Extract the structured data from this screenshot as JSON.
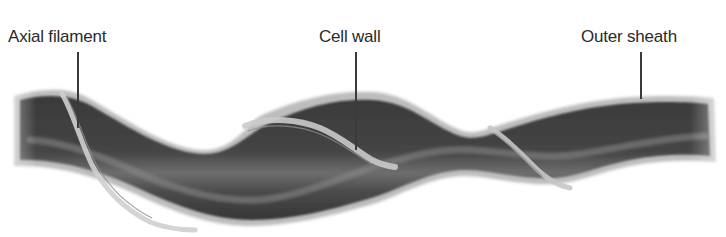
{
  "diagram": {
    "labels": [
      {
        "id": "axial-filament",
        "text": "Axial filament",
        "x": 8,
        "y": 26,
        "line_x": 77,
        "line_y1": 52,
        "line_y2": 128
      },
      {
        "id": "cell-wall",
        "text": "Cell wall",
        "x": 319,
        "y": 26,
        "line_x": 355,
        "line_y1": 52,
        "line_y2": 150
      },
      {
        "id": "outer-sheath",
        "text": "Outer sheath",
        "x": 581,
        "y": 26,
        "line_x": 640,
        "line_y1": 52,
        "line_y2": 100
      }
    ],
    "colors": {
      "background": "#ffffff",
      "sheath": "#b8b8b8",
      "cell_body_dark": "#3c3c3c",
      "cell_body_mid": "#6a6a6a",
      "highlight": "#9a9a9a",
      "filament": "#c9c9c9",
      "text": "#2a2a2a"
    }
  }
}
